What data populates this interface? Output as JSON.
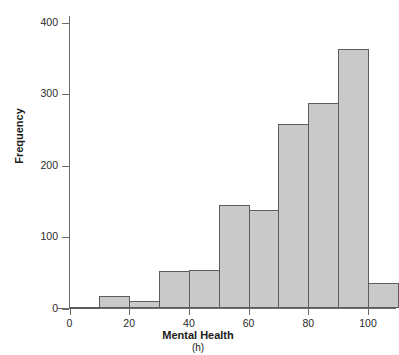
{
  "chart_data": {
    "type": "bar",
    "title": "",
    "xlabel": "Mental Health",
    "xunits": "(h)",
    "ylabel": "Frequency",
    "bin_width": 10,
    "bin_starts": [
      0,
      10,
      20,
      30,
      40,
      50,
      60,
      70,
      80,
      90,
      100
    ],
    "categories": [
      "0-10",
      "10-20",
      "20-30",
      "30-40",
      "40-50",
      "50-60",
      "60-70",
      "70-80",
      "80-90",
      "90-100",
      "100-110"
    ],
    "values": [
      2,
      17,
      10,
      53,
      54,
      145,
      138,
      258,
      288,
      363,
      35
    ],
    "xlim": [
      -10,
      115
    ],
    "ylim": [
      0,
      410
    ],
    "xticks": [
      0,
      20,
      40,
      60,
      80,
      100
    ],
    "xtick_labels": [
      "0",
      "20",
      "40",
      "60",
      "80",
      "100"
    ],
    "yticks": [
      0,
      100,
      200,
      300,
      400
    ],
    "ytick_labels": [
      "0",
      "100",
      "200",
      "300",
      "400"
    ],
    "grid": false,
    "legend": null,
    "bar_fill_color": "#c9c9c9",
    "bar_edge_color": "#5d5d5d",
    "axis_color": "#6b6b6b"
  }
}
